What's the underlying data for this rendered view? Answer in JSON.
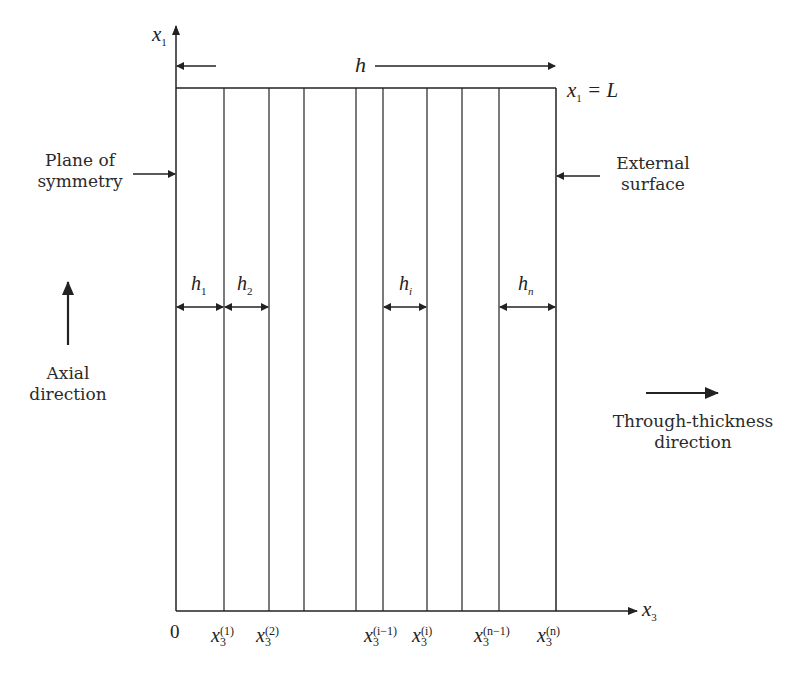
{
  "diagram": {
    "type": "layered-slab-cross-section",
    "axes": {
      "vertical": {
        "label": "x",
        "subscript": "1"
      },
      "horizontal": {
        "label": "x",
        "subscript": "3"
      },
      "origin": "0"
    },
    "thickness_label": "h",
    "top_boundary": {
      "label": "x",
      "subscript": "1",
      "rhs": "= L"
    },
    "left_annotation": [
      "Plane of",
      "symmetry"
    ],
    "right_annotation": [
      "External",
      "surface"
    ],
    "axial_direction": [
      "Axial",
      "direction"
    ],
    "through_thickness_direction": [
      "Through-thickness",
      "direction"
    ],
    "layer_thickness_labels": [
      {
        "base": "h",
        "subscript": "1"
      },
      {
        "base": "h",
        "subscript": "2"
      },
      {
        "base": "h",
        "subscript": "i"
      },
      {
        "base": "h",
        "subscript": "n"
      }
    ],
    "interface_labels": [
      {
        "base": "x",
        "superscript": "(1)",
        "subscript": "3"
      },
      {
        "base": "x",
        "superscript": "(2)",
        "subscript": "3"
      },
      {
        "base": "x",
        "superscript": "(i−1)",
        "subscript": "3"
      },
      {
        "base": "x",
        "superscript": "(i)",
        "subscript": "3"
      },
      {
        "base": "x",
        "superscript": "(n−1)",
        "subscript": "3"
      },
      {
        "base": "x",
        "superscript": "(n)",
        "subscript": "3"
      }
    ],
    "colors": {
      "line": "#222222",
      "text": "#2a2a2a",
      "background": "#ffffff"
    }
  }
}
